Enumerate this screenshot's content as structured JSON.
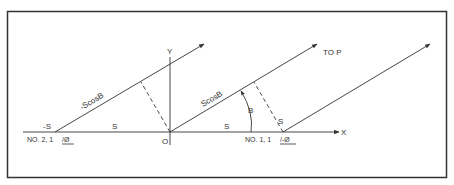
{
  "diagram": {
    "type": "two-element array geometry (path difference)",
    "colors": {
      "line": "#333333",
      "frame": "#333333",
      "background": "#ffffff"
    },
    "labels": {
      "y_axis": "Y",
      "x_axis": "X",
      "origin": "O",
      "left_source": "-S",
      "left_spacing": "S",
      "right_spacing": "S",
      "right_perp": "S",
      "left_path": "-ScosB",
      "center_path": "ScosB",
      "direction": "TO P",
      "angle": "B",
      "element_2": "NO. 2, 1",
      "element_2_phase": "/Ø",
      "element_1": "NO. 1, 1",
      "element_1_phase": "/-Ø"
    }
  }
}
